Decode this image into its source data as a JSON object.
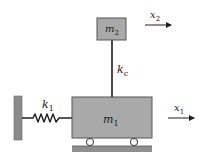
{
  "diagram": {
    "type": "two-mass spring system",
    "colors": {
      "mass_fill": "#a9a9a9",
      "mass_stroke": "#555555",
      "wall_fill": "#8c8c8c",
      "ground_fill": "#8f8f8f",
      "line": "#1e1e1e"
    },
    "masses": [
      {
        "id": "m1",
        "label": "m",
        "subscript": "1"
      },
      {
        "id": "m2",
        "label": "m",
        "subscript": "2"
      }
    ],
    "springs": [
      {
        "id": "k1",
        "label": "k",
        "subscript": "1"
      },
      {
        "id": "kc",
        "label": "k",
        "subscript": "c"
      }
    ],
    "displacements": [
      {
        "id": "x1",
        "label": "x",
        "subscript": "1"
      },
      {
        "id": "x2",
        "label": "x",
        "subscript": "2"
      }
    ]
  }
}
